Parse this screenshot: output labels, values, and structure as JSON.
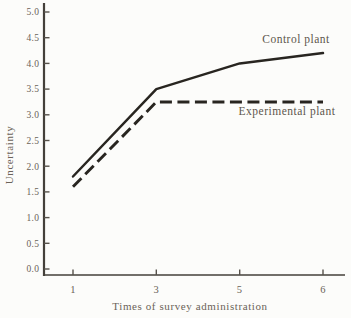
{
  "figure": {
    "background_color": "#fcfcfa",
    "line_color": "#282520",
    "text_color": "#6b6358",
    "axis_color": "#44403a"
  },
  "chart_data": {
    "type": "line",
    "title": "",
    "xlabel": "Times of survey administration",
    "ylabel": "Uncertainty",
    "x": [
      1,
      3,
      5,
      6
    ],
    "x_tick_labels": [
      "1",
      "3",
      "5",
      "6"
    ],
    "y_tick_labels": [
      "5.0",
      "4.5",
      "4.0",
      "3.5",
      "3.0",
      "2.5",
      "2.0",
      "1.5",
      "1.0",
      "0.5",
      "0.0"
    ],
    "ylim": [
      0.0,
      5.0
    ],
    "grid": false,
    "legend_position": "inline-annotations",
    "series": [
      {
        "name": "Control plant",
        "line_style": "solid",
        "values": [
          1.8,
          3.5,
          4.0,
          4.2
        ]
      },
      {
        "name": "Experimental plant",
        "line_style": "dashed",
        "values": [
          1.6,
          3.25,
          3.25,
          3.25
        ]
      }
    ]
  }
}
